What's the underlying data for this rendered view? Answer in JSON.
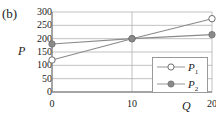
{
  "panel": {
    "label": "(b)"
  },
  "axes": {
    "y_title": "P",
    "x_title": "Q",
    "y_ticks": [
      "300",
      "250",
      "200",
      "150",
      "100",
      "50",
      "0"
    ],
    "x_ticks": [
      "0",
      "10",
      "20"
    ]
  },
  "legend": {
    "entries": [
      {
        "name": "P",
        "sub": "1",
        "marker": "open-circle"
      },
      {
        "name": "P",
        "sub": "2",
        "marker": "filled-circle"
      }
    ]
  },
  "colors": {
    "line": "#8a8a8a",
    "marker_fill": "#8a8a8a",
    "marker_open_fill": "#ffffff",
    "marker_edge": "#6e6e6e",
    "grid": "#a8a8a8",
    "axis": "#6a6a6a",
    "text": "#1a1a1a"
  },
  "chart_data": {
    "type": "line",
    "title": "(b)",
    "xlabel": "Q",
    "ylabel": "P",
    "x": [
      0,
      10,
      20
    ],
    "xlim": [
      0,
      20
    ],
    "ylim": [
      0,
      300
    ],
    "y_tick_values": [
      0,
      50,
      100,
      150,
      200,
      250,
      300
    ],
    "x_tick_values": [
      0,
      10,
      20
    ],
    "grid": true,
    "legend_position": "lower-right",
    "series": [
      {
        "name": "P1",
        "label": "P₁",
        "marker": "open-circle",
        "values": [
          120,
          200,
          275
        ]
      },
      {
        "name": "P2",
        "label": "P₂",
        "marker": "filled-circle",
        "values": [
          180,
          200,
          215
        ]
      }
    ]
  }
}
